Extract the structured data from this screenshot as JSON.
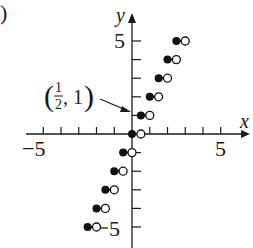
{
  "panel_label": ")",
  "chart_data": {
    "type": "scatter",
    "title": "",
    "xlabel": "x",
    "ylabel": "y",
    "xlim": [
      -6,
      6
    ],
    "ylim": [
      -6,
      6
    ],
    "x_tick_labels": [
      "-5",
      "5"
    ],
    "y_tick_labels": [
      "5",
      "-5"
    ],
    "annotation": {
      "text": "(1/2, 1)",
      "point": [
        0.5,
        1
      ]
    },
    "closed_points": [
      [
        -2.5,
        -5
      ],
      [
        -2,
        -4
      ],
      [
        -1.5,
        -3
      ],
      [
        -1,
        -2
      ],
      [
        -0.5,
        -1
      ],
      [
        0,
        0
      ],
      [
        0.5,
        1
      ],
      [
        1,
        2
      ],
      [
        1.5,
        3
      ],
      [
        2,
        4
      ],
      [
        2.5,
        5
      ]
    ],
    "open_points": [
      [
        -2,
        -5
      ],
      [
        -1.5,
        -4
      ],
      [
        -1,
        -3
      ],
      [
        -0.5,
        -2
      ],
      [
        0,
        -1
      ],
      [
        0.5,
        0
      ],
      [
        1,
        1
      ],
      [
        1.5,
        2
      ],
      [
        2,
        3
      ],
      [
        2.5,
        4
      ],
      [
        3,
        5
      ]
    ],
    "grid": false
  },
  "labels": {
    "x_axis": "x",
    "y_axis": "y",
    "x_neg5": "−5",
    "x_pos5": "5",
    "y_pos5": "5",
    "y_neg5": "5",
    "annot_num": "1",
    "annot_den": "2",
    "annot_rest": ", 1"
  }
}
